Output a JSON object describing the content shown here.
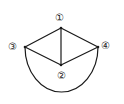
{
  "diagram": {
    "type": "graph",
    "nodes": [
      {
        "id": "1",
        "label": "①",
        "x": 61,
        "y": 28,
        "label_x": 55,
        "label_y": 14
      },
      {
        "id": "2",
        "label": "②",
        "x": 61,
        "y": 65,
        "label_x": 55,
        "label_y": 70
      },
      {
        "id": "3",
        "label": "③",
        "x": 25,
        "y": 47,
        "label_x": 6,
        "label_y": 42
      },
      {
        "id": "4",
        "label": "④",
        "x": 98,
        "y": 47,
        "label_x": 99,
        "label_y": 41
      }
    ],
    "edges": [
      {
        "from": "1",
        "to": "3",
        "shape": "line"
      },
      {
        "from": "1",
        "to": "4",
        "shape": "line"
      },
      {
        "from": "1",
        "to": "2",
        "shape": "line"
      },
      {
        "from": "3",
        "to": "2",
        "shape": "line"
      },
      {
        "from": "4",
        "to": "2",
        "shape": "line"
      },
      {
        "from": "3",
        "to": "4",
        "shape": "semicircle-arc-below"
      }
    ],
    "stroke_color": "#1a1a1a"
  }
}
